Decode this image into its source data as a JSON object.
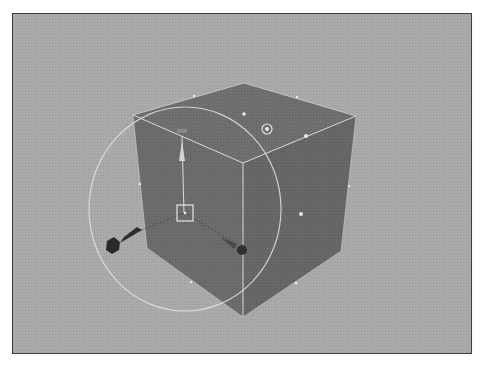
{
  "viewport": {
    "label": "3D perspective viewport",
    "background_color": "#a9a9a9",
    "border_color": "#3a3a3a"
  },
  "object": {
    "type": "polygon-cube",
    "label": "cube",
    "face_color_left": "#6b6b6b",
    "face_color_right": "#666666",
    "face_color_top": "#6e6e6e",
    "edge_color": "#d8d8d8",
    "selected": true
  },
  "manipulator": {
    "type": "move-rotate-tool",
    "label": "manipulator",
    "ring_color": "#e2e2e2",
    "handle_color": "#333333",
    "center_box_color": "#e6e6e6",
    "icons": [
      "up-arrow-handle-icon",
      "left-cone-handle-icon",
      "pivot-target-icon",
      "center-box-handle-icon"
    ]
  }
}
